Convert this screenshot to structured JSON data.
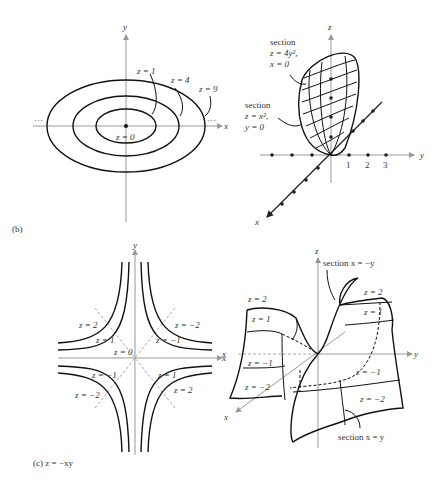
{
  "panel_b_contour": {
    "x_axis": "x",
    "y_axis": "y",
    "levels": [
      "z = 0",
      "z = 1",
      "z = 4",
      "z = 9"
    ],
    "ellipsis_left": "···",
    "ellipsis_right": "···"
  },
  "panel_b_surface": {
    "z_axis": "z",
    "y_axis": "y",
    "x_axis": "x",
    "y_ticks": [
      "1",
      "2",
      "3"
    ],
    "section1": [
      "section",
      "z = 4y²,",
      "x = 0"
    ],
    "section2": [
      "section",
      "z = x²,",
      "y = 0"
    ]
  },
  "panel_b_caption": "(b)",
  "panel_c_contour": {
    "x_axis": "x",
    "y_axis": "y",
    "labels": [
      "z = 2",
      "z = 1",
      "z = 0",
      "z = −2",
      "z = −1",
      "z = −1",
      "z = −2",
      "z = 1",
      "z = 2"
    ]
  },
  "panel_c_surface": {
    "z_axis": "z",
    "y_axis": "y",
    "x_axis": "x",
    "x_axis_left": "x",
    "section_top": "section x = −y",
    "section_bottom": "section x = y",
    "labels": [
      "z = 2",
      "z = 1",
      "z = −1",
      "z = −2",
      "z = 2",
      "z = 1",
      "z = −1",
      "z = −2"
    ]
  },
  "panel_c_caption": "(c)  z = −xy"
}
